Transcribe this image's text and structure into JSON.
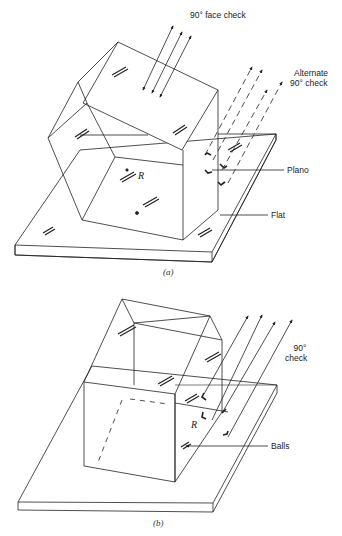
{
  "figure_a": {
    "caption": "(a)",
    "labels": {
      "face_check": "90° face check",
      "alternate_line1": "Alternate",
      "alternate_line2": "90° check",
      "plano": "Plano",
      "flat": "Flat",
      "r": "R"
    }
  },
  "figure_b": {
    "caption": "(b)",
    "labels": {
      "check_line1": "90°",
      "check_line2": "check",
      "balls": "Balls",
      "r": "R"
    }
  },
  "colors": {
    "line": "#222222",
    "background": "#ffffff"
  }
}
